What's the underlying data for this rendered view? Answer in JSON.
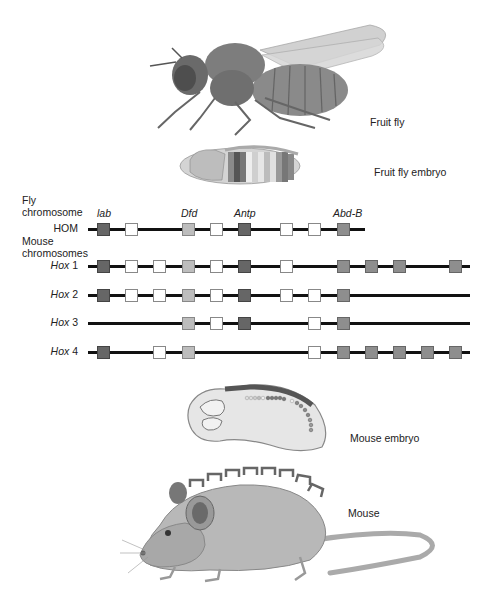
{
  "organisms": {
    "fruit_fly": "Fruit fly",
    "fruit_fly_embryo": "Fruit fly embryo",
    "mouse_embryo": "Mouse embryo",
    "mouse": "Mouse"
  },
  "section_labels": {
    "fly_chromosome_line1": "Fly",
    "fly_chromosome_line2": "chromosome",
    "mouse_chromosomes_line1": "Mouse",
    "mouse_chromosomes_line2": "chromosomes"
  },
  "gene_labels": {
    "lab": "lab",
    "dfd": "Dfd",
    "antp": "Antp",
    "abdb": "Abd-B"
  },
  "colors": {
    "dark": "#666666",
    "mid": "#8e8e8e",
    "light": "#bdbdbd",
    "white": "#ffffff",
    "line": "#111111"
  },
  "rows": [
    {
      "prefix": "",
      "label": "HOM",
      "y": 229,
      "x_start": 88,
      "x_end": 365,
      "genes": [
        [
          104,
          "dark"
        ],
        [
          132,
          "white"
        ],
        [
          189,
          "light"
        ],
        [
          217,
          "white"
        ],
        [
          245,
          "dark"
        ],
        [
          287,
          "white"
        ],
        [
          315,
          "white"
        ],
        [
          344,
          "mid"
        ]
      ]
    },
    {
      "prefix": "Hox",
      "label": "1",
      "y": 266,
      "x_start": 88,
      "x_end": 470,
      "genes": [
        [
          104,
          "dark"
        ],
        [
          132,
          "white"
        ],
        [
          160,
          "white"
        ],
        [
          189,
          "light"
        ],
        [
          217,
          "white"
        ],
        [
          245,
          "dark"
        ],
        [
          287,
          "white"
        ],
        [
          344,
          "mid"
        ],
        [
          372,
          "mid"
        ],
        [
          400,
          "mid"
        ],
        [
          456,
          "mid"
        ]
      ]
    },
    {
      "prefix": "Hox",
      "label": "2",
      "y": 295,
      "x_start": 88,
      "x_end": 470,
      "genes": [
        [
          104,
          "dark"
        ],
        [
          132,
          "white"
        ],
        [
          160,
          "white"
        ],
        [
          189,
          "light"
        ],
        [
          217,
          "white"
        ],
        [
          245,
          "dark"
        ],
        [
          287,
          "white"
        ],
        [
          315,
          "white"
        ],
        [
          344,
          "mid"
        ]
      ]
    },
    {
      "prefix": "Hox",
      "label": "3",
      "y": 323,
      "x_start": 88,
      "x_end": 470,
      "genes": [
        [
          189,
          "light"
        ],
        [
          217,
          "white"
        ],
        [
          245,
          "dark"
        ],
        [
          315,
          "white"
        ],
        [
          344,
          "mid"
        ]
      ]
    },
    {
      "prefix": "Hox",
      "label": "4",
      "y": 352,
      "x_start": 88,
      "x_end": 470,
      "genes": [
        [
          104,
          "dark"
        ],
        [
          160,
          "white"
        ],
        [
          189,
          "light"
        ],
        [
          315,
          "white"
        ],
        [
          344,
          "mid"
        ],
        [
          372,
          "mid"
        ],
        [
          400,
          "mid"
        ],
        [
          428,
          "mid"
        ],
        [
          456,
          "mid"
        ]
      ]
    }
  ]
}
